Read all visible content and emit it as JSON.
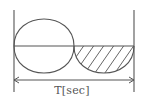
{
  "diagram": {
    "type": "waveform",
    "period_label": "T[sec]",
    "colors": {
      "line": "#555555",
      "background": "#ffffff",
      "hatch": "#555555"
    },
    "geometry": {
      "left_marker_x": 14,
      "right_marker_x": 134,
      "axis_y": 46,
      "crossing_x": 74,
      "peak_y": 20,
      "trough_y": 73,
      "arrow_y": 80
    },
    "regions": [
      {
        "name": "left-lobe",
        "range": [
          0,
          0.5
        ],
        "arcs": [
          "upper",
          "lower"
        ],
        "hatched": false
      },
      {
        "name": "right-lobe",
        "range": [
          0.5,
          1
        ],
        "arcs": [
          "lower"
        ],
        "hatched": true
      }
    ]
  }
}
